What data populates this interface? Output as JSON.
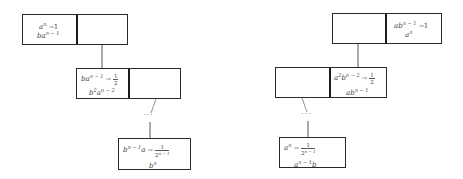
{
  "diagram": {
    "left_tree": {
      "top": {
        "left_cell": {
          "line1": "a^n → 1",
          "line2": "b a^(n-1)"
        },
        "right_cell": ""
      },
      "middle": {
        "left_cell": {
          "line1": "b a^(n-1) → 1/2",
          "line2": "b^2 a^(n-2)"
        },
        "right_cell": ""
      },
      "ellipsis": "···",
      "bottom": {
        "line1": "b^(n-1) a → 1/2^(n-1)",
        "line2": "b^n"
      }
    },
    "right_tree": {
      "top": {
        "left_cell": "",
        "right_cell": {
          "line1": "a b^(n-1) → 1",
          "line2": "a^n"
        }
      },
      "middle": {
        "left_cell": "",
        "right_cell": {
          "line1": "a^2 b^(n-2) → 1/2",
          "line2": "a b^(n-1)"
        }
      },
      "ellipsis": "···",
      "bottom": {
        "line1": "a^n → 1/2^(n-1)",
        "line2": "a^(n-1) b"
      }
    }
  },
  "tokens": {
    "a": "a",
    "b": "b",
    "ba": "ba",
    "ab": "ab",
    "b2": "b",
    "a2": "a",
    "exp_n": "n",
    "exp_n1": "n − 1",
    "exp_n2": "n − 2",
    "exp_2": "2",
    "exp_1": "1",
    "arrow": "→",
    "one": "1",
    "half_num": "1",
    "half_den": "2",
    "frac_num": "1",
    "frac_den": "2",
    "frac_den_exp": "n − 1",
    "ellipsis": "···"
  }
}
